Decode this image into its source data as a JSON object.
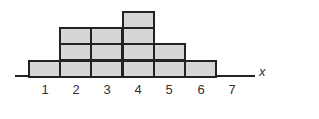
{
  "chart_data": {
    "type": "bar",
    "subtype": "stacked-unit-squares",
    "categories": [
      "1",
      "2",
      "3",
      "4",
      "5",
      "6",
      "7"
    ],
    "values": [
      1,
      3,
      3,
      4,
      2,
      1,
      0
    ],
    "title": "",
    "xlabel": "x",
    "ylabel": "",
    "ylim": [
      0,
      4
    ],
    "grid": false,
    "legend": null,
    "colors": {
      "fill": "#d6d6d6",
      "stroke": "#222222"
    }
  }
}
